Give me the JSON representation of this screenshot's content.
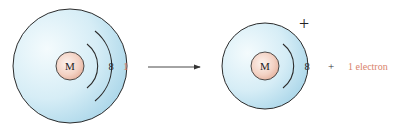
{
  "diagram": {
    "colors": {
      "shell_fill_light": "#f2fafd",
      "shell_fill_dark": "#a8d5e8",
      "outline": "#2b2b2b",
      "nucleus_light": "#fbeee6",
      "nucleus_dark": "#e7b8a5",
      "electron_text": "#d9826a",
      "text": "#222222"
    },
    "atom": {
      "nucleus_label": "M",
      "shells": [
        "8",
        "1"
      ]
    },
    "arrow": {
      "direction": "right"
    },
    "ion": {
      "nucleus_label": "M",
      "charge": "+",
      "shells": [
        "8"
      ]
    },
    "products": {
      "plus": "+",
      "electron_label": "1 electron"
    }
  }
}
